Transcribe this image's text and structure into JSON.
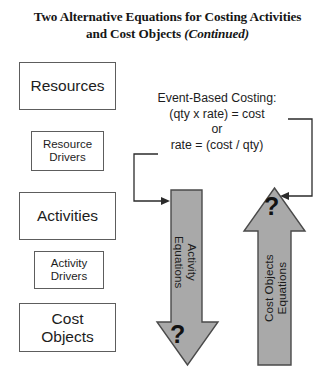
{
  "figure": {
    "title": {
      "line1": "Two Alternative Equations for Costing Activities",
      "line2_main": "and Cost Objects ",
      "line2_italic": "(Continued)"
    },
    "colors": {
      "arrow_fill": "#a9a9a9",
      "arrow_stroke": "#4a4a4a",
      "box_stroke": "#5d5d5d",
      "text": "#1d1d1d",
      "background": "#ffffff",
      "connector": "#2b2b2b"
    },
    "boxes": [
      {
        "name": "resources",
        "label": "Resources",
        "size": "large"
      },
      {
        "name": "resource-drivers",
        "label": "Resource\nDrivers",
        "line1": "Resource",
        "line2": "Drivers",
        "size": "small"
      },
      {
        "name": "activities",
        "label": "Activities",
        "size": "large"
      },
      {
        "name": "activity-drivers",
        "label": "Activity\nDrivers",
        "line1": "Activity",
        "line2": "Drivers",
        "size": "small"
      },
      {
        "name": "cost-objects",
        "label": "Cost\nObjects",
        "line1": "Cost",
        "line2": "Objects",
        "size": "large"
      }
    ],
    "equations": {
      "heading": "Event-Based Costing:",
      "line1": "(qty x rate) = cost",
      "connector_word": "or",
      "line2": "rate = (cost / qty)"
    },
    "arrows": [
      {
        "name": "activity-equations-arrow",
        "direction": "down",
        "label_line1": "Activity",
        "label_line2": "Equations",
        "label": "Activity Equations",
        "head_symbol": "?"
      },
      {
        "name": "cost-objects-equations-arrow",
        "direction": "up",
        "label_line1": "Cost Objects",
        "label_line2": "Equations",
        "label": "Cost Objects Equations",
        "head_symbol": "?"
      }
    ]
  }
}
